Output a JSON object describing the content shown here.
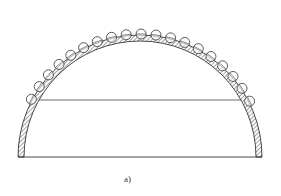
{
  "figure": {
    "caption": "a)",
    "colors": {
      "stroke": "#333333",
      "hatch": "#555555",
      "background": "#ffffff"
    },
    "geometry": {
      "center": [
        140,
        157
      ],
      "outer_radius": 122,
      "wall_thickness": 6,
      "base_y": 157,
      "chord_y": 100,
      "coil_radius": 5,
      "coil_count": 19,
      "coil_angle_start_deg": 152,
      "coil_angle_end_deg": 27
    }
  }
}
